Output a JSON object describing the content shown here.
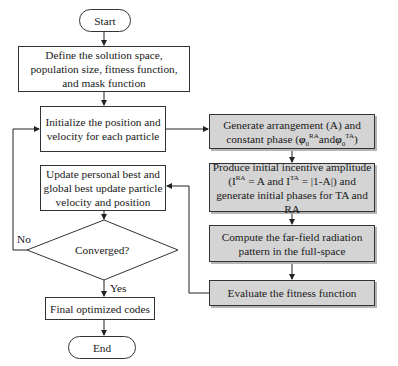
{
  "flowchart": {
    "start": {
      "label": "Start"
    },
    "define": {
      "lines": [
        "Define the solution space,",
        "population size, fitness function,",
        "and mask function"
      ]
    },
    "initialize": {
      "lines": [
        "Initialize the position and",
        "velocity for each particle"
      ]
    },
    "update": {
      "lines": [
        "Update personal best and",
        "global best update particle",
        "velocity and position"
      ]
    },
    "decision": {
      "label": "Converged?",
      "no_label": "No",
      "yes_label": "Yes"
    },
    "final": {
      "label": "Final optimized codes"
    },
    "end": {
      "label": "End"
    },
    "generate": {
      "line1": "Generate arrangement (A) and",
      "line2_prefix": "constant phase (",
      "phi": "φ",
      "sub": "0",
      "sup_ra": "RA",
      "and": "and",
      "sup_ta": "TA",
      "close": ")"
    },
    "produce": {
      "line1": "Produce initial incentive amplitude",
      "line2_open": "(I",
      "sup_ra": "RA",
      "line2_mid": " = A and I",
      "sup_ta": "TA",
      "line2_end": " = |1-A|) and",
      "line3": "generate initial phases for TA and RA"
    },
    "compute": {
      "lines": [
        "Compute the far-field radiation",
        "pattern in the full-space"
      ]
    },
    "evaluate": {
      "label": "Evaluate the fitness function"
    },
    "colors": {
      "process_fill": "#d4d4d4",
      "stroke": "#333333",
      "background": "#ffffff"
    }
  }
}
